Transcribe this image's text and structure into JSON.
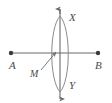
{
  "figure": {
    "background_color": "#ffffff",
    "stroke_color": "#6b6b6b",
    "label_color": "#4a4a4a",
    "labels": {
      "a": "A",
      "b": "B",
      "m": "M",
      "x": "X",
      "y": "Y"
    },
    "points": {
      "a": {
        "x": 11,
        "y": 53,
        "name": "endpoint-a"
      },
      "b": {
        "x": 98,
        "y": 53,
        "name": "endpoint-b"
      },
      "m": {
        "x": 60,
        "y": 53,
        "name": "midpoint-m"
      },
      "x": {
        "x": 60,
        "y": 20,
        "name": "arc-intersection-x"
      },
      "y": {
        "x": 60,
        "y": 88,
        "name": "arc-intersection-y"
      }
    },
    "segment_ab": {
      "x1": 11,
      "y1": 53,
      "x2": 98,
      "y2": 53
    },
    "line_xy": {
      "x1": 60,
      "y1": 8,
      "x2": 60,
      "y2": 100
    },
    "arc_left": {
      "start_x": 60,
      "start_y": 16,
      "end_x": 60,
      "end_y": 92,
      "bulge_x": 47
    },
    "arc_right": {
      "start_x": 60,
      "start_y": 16,
      "end_x": 60,
      "end_y": 92,
      "bulge_x": 73
    },
    "pointer_m": {
      "x1": 42,
      "y1": 69,
      "x2": 56,
      "y2": 52
    },
    "arrowheads": [
      "top-of-line-xy",
      "bottom-of-line-xy",
      "pointer-to-midpoint"
    ],
    "dot_radius": 2.2
  }
}
